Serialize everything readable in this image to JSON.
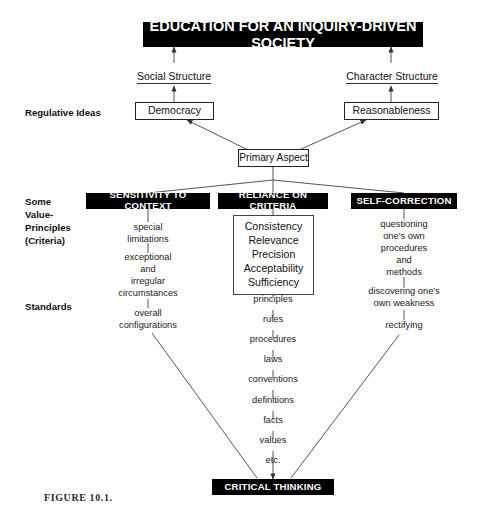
{
  "figure": {
    "caption": "FIGURE 10.1."
  },
  "title_banner": {
    "label": "EDUCATION FOR AN INQUIRY-DRIVEN SOCIETY"
  },
  "structures": [
    {
      "label": "Social Structure"
    },
    {
      "label": "Character Structure"
    }
  ],
  "regulative_ideas": {
    "margin_label": "Regulative Ideas",
    "items": [
      {
        "label": "Democracy"
      },
      {
        "label": "Reasonableness"
      }
    ]
  },
  "primary_aspect": {
    "label": "Primary Aspect"
  },
  "margin_labels": {
    "value_principles": "Some\nValue-\nPrinciples\n(Criteria)",
    "value_principles_lines": [
      "Some",
      "Value-",
      "Principles",
      "(Criteria)"
    ],
    "standards": "Standards"
  },
  "categories": [
    {
      "label": "SENSITIVITY TO CONTEXT"
    },
    {
      "label": "RELIANCE ON CRITERIA"
    },
    {
      "label": "SELF-CORRECTION"
    }
  ],
  "left_branch": {
    "nodes": [
      {
        "label": "special\nlimitations",
        "lines": [
          "special",
          "limitations"
        ]
      },
      {
        "label": "exceptional\nand\nirregular\ncircumstances",
        "lines": [
          "exceptional",
          "and",
          "irregular",
          "circumstances"
        ]
      },
      {
        "label": "overall\nconfigurations",
        "lines": [
          "overall",
          "configurations"
        ]
      }
    ]
  },
  "middle_branch": {
    "criteria_box": {
      "items": [
        "Consistency",
        "Relevance",
        "Precision",
        "Acceptability",
        "Sufficiency"
      ]
    },
    "standards_chain": [
      "principles",
      "rules",
      "procedures",
      "laws",
      "conventions",
      "definitions",
      "facts",
      "values",
      "etc."
    ]
  },
  "right_branch": {
    "nodes": [
      {
        "label": "questioning\none's own\nprocedures\nand\nmethods",
        "lines": [
          "questioning",
          "one's own",
          "procedures",
          "and",
          "methods"
        ]
      },
      {
        "label": "discovering one's\nown weakness",
        "lines": [
          "discovering one's",
          "own weakness"
        ]
      },
      {
        "label": "rectifying",
        "lines": [
          "rectifying"
        ]
      }
    ]
  },
  "bottom_banner": {
    "label": "CRITICAL THINKING"
  },
  "colors": {
    "banner_bg": "#000000",
    "banner_text": "#ffffff",
    "line": "#555555",
    "page_bg": "#ffffff"
  }
}
